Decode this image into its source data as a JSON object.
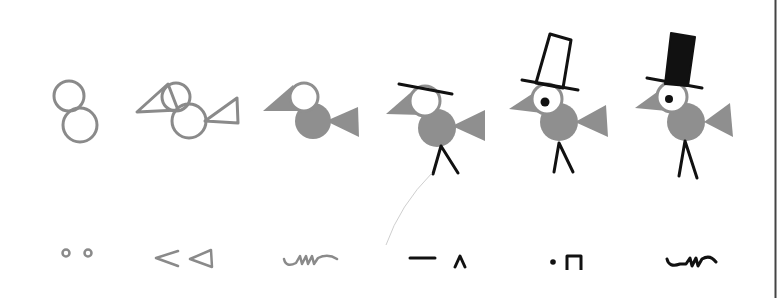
{
  "title": "Bird drawing stages and shorthand symbols",
  "colors": {
    "background": "#ffffff",
    "gray_stroke": "#8a8a8a",
    "gray_fill": "#8f8f8f",
    "black": "#111111",
    "border": "#444444",
    "pointer_line": "#cccccc"
  },
  "figures": [
    {
      "index": 1,
      "label": "two circles outline",
      "symbol": "∘∘"
    },
    {
      "index": 2,
      "label": "circles with beak and tail outline",
      "symbol": "< ◁"
    },
    {
      "index": 3,
      "label": "filled body, beak and tail",
      "symbol": "squiggle"
    },
    {
      "index": 4,
      "label": "hat brim and legs added",
      "symbol": "— ∧"
    },
    {
      "index": 5,
      "label": "top hat outline and eye added",
      "symbol": "•Π"
    },
    {
      "index": 6,
      "label": "filled black top hat",
      "symbol": "squiggle (black)"
    }
  ],
  "glyphs": {
    "g1": "∘∘",
    "g2": "< ◁",
    "g4": "— ∧",
    "g5": "•Π"
  }
}
